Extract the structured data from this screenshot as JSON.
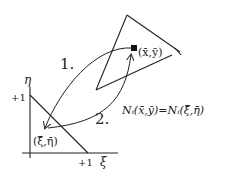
{
  "diagram": {
    "labels": {
      "step1": "1.",
      "step2": "2.",
      "point_global": "(x̄,ȳ)",
      "point_local": "(ξ̄,η̄)",
      "equation": "Nᵢ(x̄,ȳ)=Nᵢ(ξ̄,η̄)",
      "axis_eta": "η",
      "axis_xi": "ξ",
      "eta_tick": "+1",
      "xi_tick": "+1"
    },
    "colors": {
      "stroke": "#222222",
      "background": "#ffffff"
    }
  }
}
